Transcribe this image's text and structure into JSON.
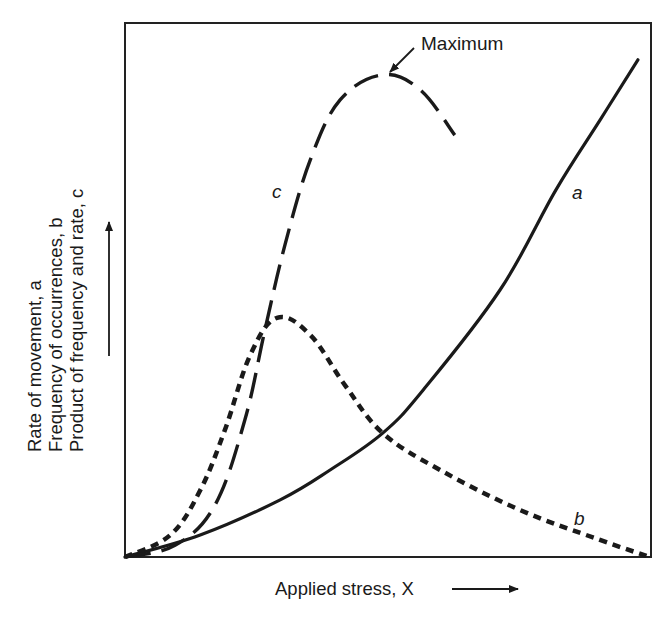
{
  "chart_data": {
    "type": "line",
    "title": "",
    "xlabel": "Applied stress, X",
    "ylabel_lines": [
      "Rate of movement, a",
      "Frequency of occurrences, b",
      "Product of frequency and rate, c"
    ],
    "xlim": [
      0,
      10
    ],
    "ylim": [
      0,
      10
    ],
    "grid": false,
    "ticks": false,
    "legend": "inline curve labels",
    "series": [
      {
        "name": "a",
        "label": "Rate of movement",
        "style": "solid",
        "x": [
          0,
          1.43,
          2.95,
          3.9,
          4.9,
          5.67,
          7.13,
          8.19,
          9.03,
          9.75
        ],
        "y": [
          0,
          0.41,
          1.07,
          1.63,
          2.32,
          3.13,
          5.0,
          6.87,
          8.18,
          9.31
        ]
      },
      {
        "name": "b",
        "label": "Frequency of occurrences",
        "style": "short-dash",
        "x": [
          0,
          0.86,
          1.43,
          1.9,
          2.38,
          2.89,
          3.52,
          4.18,
          4.9,
          5.99,
          7.51,
          9.03,
          9.98
        ],
        "y": [
          0,
          0.41,
          1.25,
          2.38,
          3.78,
          4.48,
          4.16,
          3.22,
          2.32,
          1.63,
          0.88,
          0.32,
          0
        ]
      },
      {
        "name": "c",
        "label": "Product of frequency and rate",
        "style": "long-dash",
        "x": [
          0,
          0.95,
          1.71,
          2.28,
          2.66,
          3.04,
          3.52,
          4.09,
          4.9,
          5.61,
          6.27
        ],
        "y": [
          0,
          0.22,
          0.97,
          2.57,
          4.25,
          5.84,
          7.43,
          8.56,
          9.03,
          8.75,
          7.9
        ]
      }
    ],
    "annotations": [
      {
        "text": "Maximum",
        "points_to": {
          "x": 4.9,
          "y": 9.03
        }
      },
      {
        "text": "a",
        "at": {
          "x": 8.6,
          "y": 6.85
        }
      },
      {
        "text": "b",
        "at": {
          "x": 8.65,
          "y": 0.68
        }
      },
      {
        "text": "c",
        "at": {
          "x": 2.9,
          "y": 6.85
        }
      }
    ]
  },
  "labels": {
    "x_axis": "Applied stress, X",
    "y_axis_line1": "Rate of movement, a",
    "y_axis_line2": "Frequency of occurrences, b",
    "y_axis_line3": "Product of frequency and rate, c",
    "maximum": "Maximum",
    "curve_a": "a",
    "curve_b": "b",
    "curve_c": "c"
  }
}
